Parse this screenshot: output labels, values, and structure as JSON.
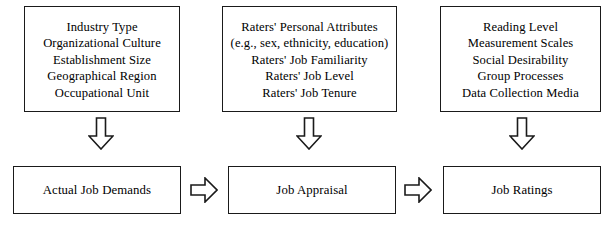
{
  "diagram": {
    "colors": {
      "outline": "#1a1a1a",
      "fill": "#ffffff",
      "text": "#000000"
    },
    "top_boxes": [
      {
        "id": "environmental",
        "lines": [
          "Industry Type",
          "Organizational Culture",
          "Establishment Size",
          "Geographical Region",
          "Occupational Unit"
        ]
      },
      {
        "id": "rater",
        "lines": [
          "Raters' Personal Attributes",
          "(e.g., sex, ethnicity, education)",
          "Raters' Job Familiarity",
          "Raters'  Job  Level",
          "Raters' Job Tenure"
        ]
      },
      {
        "id": "instrument",
        "lines": [
          "Reading Level",
          "Measurement Scales",
          "Social Desirability",
          "Group Processes",
          "Data Collection Media"
        ]
      }
    ],
    "bottom_boxes": [
      {
        "id": "actual-job-demands",
        "label": "Actual Job Demands"
      },
      {
        "id": "job-appraisal",
        "label": "Job Appraisal"
      },
      {
        "id": "job-ratings",
        "label": "Job Ratings"
      }
    ],
    "arrows": {
      "down": [
        {
          "id": "arrow-down-environmental",
          "from": "environmental",
          "to": "actual-job-demands",
          "direction": "down"
        },
        {
          "id": "arrow-down-rater",
          "from": "rater",
          "to": "job-appraisal",
          "direction": "down"
        },
        {
          "id": "arrow-down-instrument",
          "from": "instrument",
          "to": "job-ratings",
          "direction": "down"
        }
      ],
      "right": [
        {
          "id": "arrow-right-demands-appraisal",
          "from": "actual-job-demands",
          "to": "job-appraisal",
          "direction": "right"
        },
        {
          "id": "arrow-right-appraisal-ratings",
          "from": "job-appraisal",
          "to": "job-ratings",
          "direction": "right"
        }
      ]
    }
  }
}
